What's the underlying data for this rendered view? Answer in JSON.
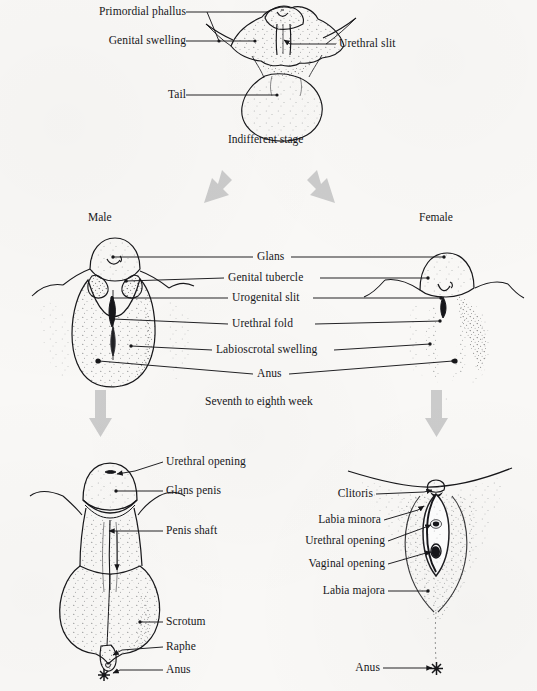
{
  "figure": {
    "title_absent": true,
    "background_color": "#f9f8f6",
    "ink_color": "#17171a",
    "arrow_color": "#c9c9c9"
  },
  "stages": [
    {
      "id": "indifferent",
      "caption": "Indifferent stage",
      "labels": [
        {
          "text": "Primordial phallus",
          "side": "left"
        },
        {
          "text": "Genital swelling",
          "side": "left"
        },
        {
          "text": "Urethral slit",
          "side": "right"
        },
        {
          "text": "Tail",
          "side": "left"
        }
      ]
    },
    {
      "id": "seventh-eighth-week",
      "caption": "Seventh to eighth week",
      "column_headings": {
        "left": "Male",
        "right": "Female"
      },
      "labels": [
        {
          "text": "Glans"
        },
        {
          "text": "Genital tubercle"
        },
        {
          "text": "Urogenital slit"
        },
        {
          "text": "Urethral fold"
        },
        {
          "text": "Labioscrotal swelling"
        },
        {
          "text": "Anus"
        }
      ]
    },
    {
      "id": "male-mature",
      "caption": "",
      "labels": [
        {
          "text": "Urethral opening",
          "side": "right"
        },
        {
          "text": "Glans penis",
          "side": "right"
        },
        {
          "text": "Penis shaft",
          "side": "right"
        },
        {
          "text": "Scrotum",
          "side": "right"
        },
        {
          "text": "Raphe",
          "side": "right"
        },
        {
          "text": "Anus",
          "side": "right"
        }
      ]
    },
    {
      "id": "female-mature",
      "caption": "",
      "labels": [
        {
          "text": "Clitoris",
          "side": "left"
        },
        {
          "text": "Labia minora",
          "side": "left"
        },
        {
          "text": "Urethral opening",
          "side": "left"
        },
        {
          "text": "Vaginal opening",
          "side": "left"
        },
        {
          "text": "Labia majora",
          "side": "left"
        },
        {
          "text": "Anus",
          "side": "left"
        }
      ]
    }
  ],
  "text": {
    "primordial_phallus": "Primordial phallus",
    "genital_swelling": "Genital swelling",
    "urethral_slit": "Urethral slit",
    "tail": "Tail",
    "indifferent_stage": "Indifferent stage",
    "male": "Male",
    "female": "Female",
    "glans": "Glans",
    "genital_tubercle": "Genital tubercle",
    "urogenital_slit": "Urogenital slit",
    "urethral_fold": "Urethral fold",
    "labioscrotal_swelling": "Labioscrotal swelling",
    "anus_mid": "Anus",
    "seventh_to_eighth_week": "Seventh to eighth week",
    "urethral_opening_m": "Urethral opening",
    "glans_penis": "Glans penis",
    "penis_shaft": "Penis shaft",
    "scrotum": "Scrotum",
    "raphe": "Raphe",
    "anus_male": "Anus",
    "clitoris": "Clitoris",
    "labia_minora": "Labia minora",
    "urethral_opening_f": "Urethral opening",
    "vaginal_opening": "Vaginal opening",
    "labia_majora": "Labia majora",
    "anus_female": "Anus"
  }
}
